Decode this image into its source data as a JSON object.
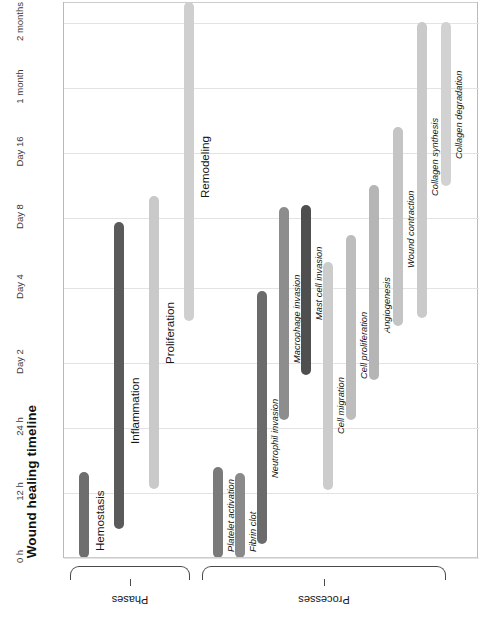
{
  "chart": {
    "title": "Wound healing timeline",
    "orientation": "rotated-90"
  },
  "axis": {
    "ticks": [
      "0 h",
      "12 h",
      "24 h",
      "Day 2",
      "Day 4",
      "Day 8",
      "Day 16",
      "1 month",
      "2 months"
    ]
  },
  "groups": [
    {
      "label": "Phases"
    },
    {
      "label": "Processes"
    }
  ],
  "colors": {
    "background": "#ffffff",
    "gridline": "#e3e3e3",
    "frame": "#b9b9b9",
    "bracket": "#4a4a4a",
    "text": "#141414"
  },
  "chart_data": {
    "type": "bar",
    "title": "Wound healing timeline",
    "xlabel": "",
    "ylabel": "",
    "grid": true,
    "legend": "none",
    "orientation": "horizontal-gantt-rotated",
    "tick_labels": [
      "0 h",
      "12 h",
      "24 h",
      "Day 2",
      "Day 4",
      "Day 8",
      "Day 16",
      "1 month",
      "2 months"
    ],
    "categories": [
      "Hemostasis",
      "Inflammation",
      "Proliferation",
      "Remodeling",
      "Platelet activation",
      "Fibrin clot",
      "Neutrophil invasion",
      "Macrophage invasion",
      "Mast cell invasion",
      "Cell migration",
      "Cell proliferation",
      "Angiogenesis",
      "Wound contraction",
      "Collagen synthesis",
      "Collagen degradation"
    ],
    "bars": [
      {
        "name": "Hemostasis",
        "group": "Phases",
        "start": "0 h",
        "end": "12 h",
        "color": "#6e6e6e"
      },
      {
        "name": "Inflammation",
        "group": "Phases",
        "start": "6 h",
        "end": "Day 8",
        "color": "#5a5a5a"
      },
      {
        "name": "Proliferation",
        "group": "Phases",
        "start": "12 h",
        "end": "Day 12",
        "color": "#c9c9c9"
      },
      {
        "name": "Remodeling",
        "group": "Phases",
        "start": "Day 5",
        "end": "2 months",
        "color": "#cfcfcf"
      },
      {
        "name": "Platelet activation",
        "group": "Processes",
        "start": "0 h",
        "end": "10 h",
        "color": "#7a7a7a"
      },
      {
        "name": "Fibrin clot",
        "group": "Processes",
        "start": "0 h",
        "end": "11 h",
        "color": "#8a8a8a"
      },
      {
        "name": "Neutrophil invasion",
        "group": "Processes",
        "start": "4 h",
        "end": "Day 5",
        "color": "#6b6b6b"
      },
      {
        "name": "Macrophage invasion",
        "group": "Processes",
        "start": "Day 2",
        "end": "Day 12",
        "color": "#8d8d8d"
      },
      {
        "name": "Mast cell invasion",
        "group": "Processes",
        "start": "Day 4",
        "end": "Day 11",
        "color": "#4f4f4f"
      },
      {
        "name": "Cell migration",
        "group": "Processes",
        "start": "18 h",
        "end": "Day 6",
        "color": "#cccccc"
      },
      {
        "name": "Cell proliferation",
        "group": "Processes",
        "start": "Day 2",
        "end": "Day 9",
        "color": "#bdbdbd"
      },
      {
        "name": "Angiogenesis",
        "group": "Processes",
        "start": "Day 3",
        "end": "Day 10",
        "color": "#b5b5b5"
      },
      {
        "name": "Wound contraction",
        "group": "Processes",
        "start": "Day 6",
        "end": "Day 18",
        "color": "#c4c4c4"
      },
      {
        "name": "Collagen synthesis",
        "group": "Processes",
        "start": "Day 4",
        "end": "2 months",
        "color": "#cacaca"
      },
      {
        "name": "Collagen degradation",
        "group": "Processes",
        "start": "Day 14",
        "end": "2 months",
        "color": "#d2d2d2"
      }
    ]
  },
  "layout": {
    "tick_y": [
      558,
      493,
      428,
      363,
      288,
      218,
      153,
      88,
      23
    ],
    "bars_px": [
      {
        "x": 78,
        "top": 472,
        "bottom": 558,
        "label_y": 551,
        "color": "#6e6e6e",
        "style": "phase"
      },
      {
        "x": 113,
        "top": 222,
        "bottom": 529,
        "label_y": 444,
        "color": "#5a5a5a",
        "style": "phase"
      },
      {
        "x": 148,
        "top": 196,
        "bottom": 489,
        "label_y": 364,
        "color": "#c9c9c9",
        "style": "phase"
      },
      {
        "x": 183,
        "top": 2,
        "bottom": 321,
        "label_y": 198,
        "color": "#cfcfcf",
        "style": "phase"
      },
      {
        "x": 212,
        "top": 467,
        "bottom": 558,
        "label_y": 552,
        "color": "#7a7a7a",
        "style": "proc"
      },
      {
        "x": 234,
        "top": 473,
        "bottom": 558,
        "label_y": 552,
        "color": "#8a8a8a",
        "style": "proc"
      },
      {
        "x": 256,
        "top": 291,
        "bottom": 544,
        "label_y": 478,
        "color": "#6b6b6b",
        "style": "proc"
      },
      {
        "x": 278,
        "top": 207,
        "bottom": 420,
        "label_y": 363,
        "color": "#8d8d8d",
        "style": "proc"
      },
      {
        "x": 300,
        "top": 205,
        "bottom": 375,
        "label_y": 320,
        "color": "#4f4f4f",
        "style": "proc"
      },
      {
        "x": 322,
        "top": 262,
        "bottom": 490,
        "label_y": 434,
        "color": "#cccccc",
        "style": "proc"
      },
      {
        "x": 345,
        "top": 235,
        "bottom": 420,
        "label_y": 379,
        "color": "#bdbdbd",
        "style": "proc"
      },
      {
        "x": 368,
        "top": 185,
        "bottom": 380,
        "label_y": 333,
        "color": "#b5b5b5",
        "style": "proc"
      },
      {
        "x": 392,
        "top": 127,
        "bottom": 326,
        "label_y": 268,
        "color": "#c4c4c4",
        "style": "proc"
      },
      {
        "x": 416,
        "top": 22,
        "bottom": 318,
        "label_y": 196,
        "color": "#cacaca",
        "style": "proc"
      },
      {
        "x": 440,
        "top": 22,
        "bottom": 186,
        "label_y": 159,
        "color": "#d2d2d2",
        "style": "proc"
      }
    ],
    "brackets": [
      {
        "left": 70,
        "width": 120,
        "label_x": 130,
        "label_y": 594
      },
      {
        "left": 202,
        "width": 244,
        "label_x": 324,
        "label_y": 594
      }
    ]
  }
}
